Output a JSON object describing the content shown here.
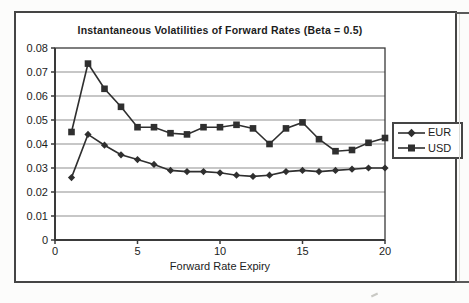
{
  "chart_data": {
    "type": "line",
    "title": "Instantaneous Volatilities of Forward Rates (Beta = 0.5)",
    "xlabel": "Forward Rate Expiry",
    "ylabel": "",
    "x": [
      1,
      2,
      3,
      4,
      5,
      6,
      7,
      8,
      9,
      10,
      11,
      12,
      13,
      14,
      15,
      16,
      17,
      18,
      19,
      20
    ],
    "series": [
      {
        "name": "EUR",
        "marker": "diamond",
        "values": [
          0.026,
          0.044,
          0.0395,
          0.0355,
          0.0335,
          0.0315,
          0.029,
          0.0285,
          0.0285,
          0.028,
          0.027,
          0.0265,
          0.027,
          0.0285,
          0.029,
          0.0285,
          0.029,
          0.0295,
          0.03,
          0.03
        ]
      },
      {
        "name": "USD",
        "marker": "square",
        "values": [
          0.045,
          0.0735,
          0.063,
          0.0555,
          0.047,
          0.047,
          0.0445,
          0.044,
          0.047,
          0.047,
          0.048,
          0.0465,
          0.04,
          0.0465,
          0.049,
          0.042,
          0.037,
          0.0375,
          0.0405,
          0.0425
        ]
      }
    ],
    "xlim": [
      0,
      20
    ],
    "ylim": [
      0,
      0.08
    ],
    "x_ticks": [
      0,
      5,
      10,
      15,
      20
    ],
    "x_tick_labels": [
      "0",
      "5",
      "10",
      "15",
      "20"
    ],
    "y_ticks": [
      0,
      0.01,
      0.02,
      0.03,
      0.04,
      0.05,
      0.06,
      0.07,
      0.08
    ],
    "y_tick_labels": [
      "0",
      "0.01",
      "0.02",
      "0.03",
      "0.04",
      "0.05",
      "0.06",
      "0.07",
      "0.08"
    ],
    "grid": "horizontal",
    "legend_position": "right",
    "colors": {
      "series": "#2f2f2f",
      "gridline": "#8f8f8f",
      "axis": "#3a3a3a",
      "text": "#1c1c1c",
      "plot_background": "#ffffff",
      "page_background": "#fcfcfb"
    }
  }
}
